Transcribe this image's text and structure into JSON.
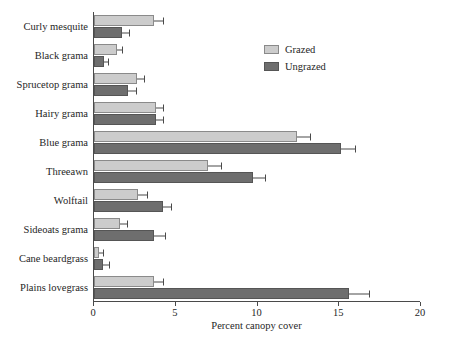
{
  "chart_data": {
    "type": "bar",
    "orientation": "horizontal",
    "title": "",
    "xlabel": "Percent canopy cover",
    "ylabel": "",
    "xlim": [
      0,
      20
    ],
    "xticks": [
      0,
      5,
      10,
      15,
      20
    ],
    "xtick_labels": [
      "0",
      "5",
      "10",
      "15",
      "20"
    ],
    "grid": false,
    "legend_position": "upper right",
    "categories": [
      "Curly mesquite",
      "Black grama",
      "Sprucetop grama",
      "Hairy grama",
      "Blue grama",
      "Threeawn",
      "Wolftail",
      "Sideoats grama",
      "Cane beardgrass",
      "Plains lovegrass"
    ],
    "series": [
      {
        "name": "Grazed",
        "color": "#cccccc",
        "values": [
          3.7,
          1.4,
          2.6,
          3.8,
          12.4,
          7.0,
          2.7,
          1.6,
          0.3,
          3.7
        ],
        "errors": [
          0.6,
          0.4,
          0.5,
          0.5,
          0.9,
          0.8,
          0.6,
          0.5,
          0.3,
          0.6
        ]
      },
      {
        "name": "Ungrazed",
        "color": "#6e6e6e",
        "values": [
          1.7,
          0.6,
          2.1,
          3.8,
          15.1,
          9.7,
          4.2,
          3.7,
          0.55,
          15.6
        ],
        "errors": [
          0.5,
          0.3,
          0.5,
          0.5,
          0.9,
          0.8,
          0.6,
          0.7,
          0.4,
          1.3
        ]
      }
    ]
  }
}
